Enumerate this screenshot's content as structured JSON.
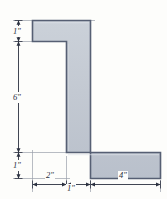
{
  "figure": {
    "shape_name": "angle-cross-section",
    "colors": {
      "fill": "#c3c9d2",
      "outline": "#565f73",
      "dimension_line": "#3b4250",
      "background": "#fdfdfb",
      "label_text": "#2a2f3d"
    },
    "dimensions": {
      "vertical": [
        {
          "id": "top-flange-thickness",
          "label": "1\"",
          "value": 1,
          "unit": "in"
        },
        {
          "id": "web-height",
          "label": "6\"",
          "value": 6,
          "unit": "in"
        },
        {
          "id": "bottom-flange-thickness",
          "label": "1\"",
          "value": 1,
          "unit": "in"
        }
      ],
      "horizontal": [
        {
          "id": "top-flange-left-overhang",
          "label": "2\"",
          "value": 2,
          "unit": "in"
        },
        {
          "id": "web-thickness",
          "label": "1\"",
          "value": 1,
          "unit": "in"
        },
        {
          "id": "bottom-flange-right-extent",
          "label": "4\"",
          "value": 4,
          "unit": "in"
        }
      ]
    },
    "total_height_label": "8\"",
    "total_width_label": "7\""
  }
}
